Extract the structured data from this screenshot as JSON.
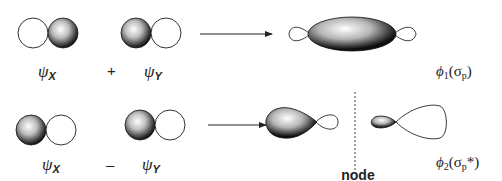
{
  "diagram": {
    "rows": [
      {
        "id": "bonding",
        "left_orbital": {
          "label": "ψ",
          "subscript": "X",
          "phases": [
            "unshaded",
            "shaded"
          ]
        },
        "operator": "+",
        "right_orbital": {
          "label": "ψ",
          "subscript": "Y",
          "phases": [
            "shaded",
            "unshaded"
          ]
        },
        "arrow": "→",
        "result": {
          "description": "bonding sigma orbital",
          "label": "ϕ",
          "index": "1",
          "open": "(σ",
          "sub": "p",
          "close": ")"
        }
      },
      {
        "id": "antibonding",
        "left_orbital": {
          "label": "ψ",
          "subscript": "X",
          "phases": [
            "shaded",
            "unshaded"
          ]
        },
        "operator": "–",
        "right_orbital": {
          "label": "ψ",
          "subscript": "Y",
          "phases": [
            "shaded",
            "unshaded"
          ]
        },
        "arrow": "→",
        "result": {
          "description": "antibonding sigma orbital",
          "label": "ϕ",
          "index": "2",
          "open": "(σ",
          "sub": "p",
          "close": "*)"
        },
        "node_label": "node"
      }
    ],
    "colors": {
      "ink": "#222222",
      "shade_light": "#ffffff",
      "shade_dark": "#111111",
      "background": "#ffffff"
    }
  }
}
